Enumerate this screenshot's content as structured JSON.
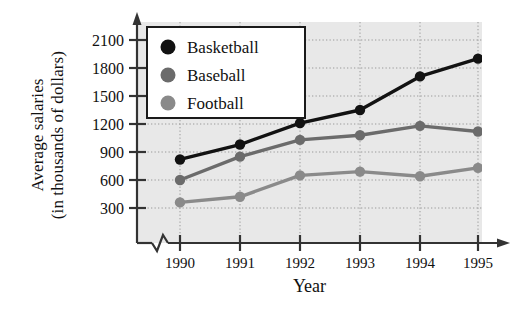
{
  "chart_data": {
    "type": "line",
    "title": "",
    "xlabel": "Year",
    "ylabel": "Average salaries (in thousands of dollars)",
    "ylabel_lines": [
      "Average salaries",
      "(in thousands of dollars)"
    ],
    "categories": [
      "1990",
      "1991",
      "1992",
      "1993",
      "1994",
      "1995"
    ],
    "x": [
      1990,
      1991,
      1992,
      1993,
      1994,
      1995
    ],
    "yticks": [
      300,
      600,
      900,
      1200,
      1500,
      1800,
      2100
    ],
    "ylim": [
      0,
      2250
    ],
    "xlim": [
      1989.5,
      1995.5
    ],
    "grid": true,
    "grid_style": "dotted",
    "axis_break": true,
    "legend_position": "upper-left",
    "plot_background": "#e8e8e8",
    "series": [
      {
        "name": "Basketball",
        "color": "#121212",
        "marker": "circle",
        "values": [
          820,
          980,
          1210,
          1350,
          1710,
          1900
        ]
      },
      {
        "name": "Baseball",
        "color": "#6b6b6b",
        "marker": "circle",
        "values": [
          600,
          850,
          1030,
          1080,
          1180,
          1120
        ]
      },
      {
        "name": "Football",
        "color": "#8a8a8a",
        "marker": "circle",
        "values": [
          360,
          420,
          650,
          690,
          640,
          730
        ]
      }
    ]
  },
  "legend": {
    "items": [
      {
        "label": "Basketball",
        "color": "#121212"
      },
      {
        "label": "Baseball",
        "color": "#6b6b6b"
      },
      {
        "label": "Football",
        "color": "#8a8a8a"
      }
    ]
  },
  "axis": {
    "y_tick_labels": [
      "2100",
      "1800",
      "1500",
      "1200",
      "900",
      "600",
      "300"
    ],
    "x_tick_labels": [
      "1990",
      "1991",
      "1992",
      "1993",
      "1994",
      "1995"
    ],
    "x_title": "Year",
    "y_title_line1": "Average salaries",
    "y_title_line2": "(in thousands of dollars)"
  }
}
